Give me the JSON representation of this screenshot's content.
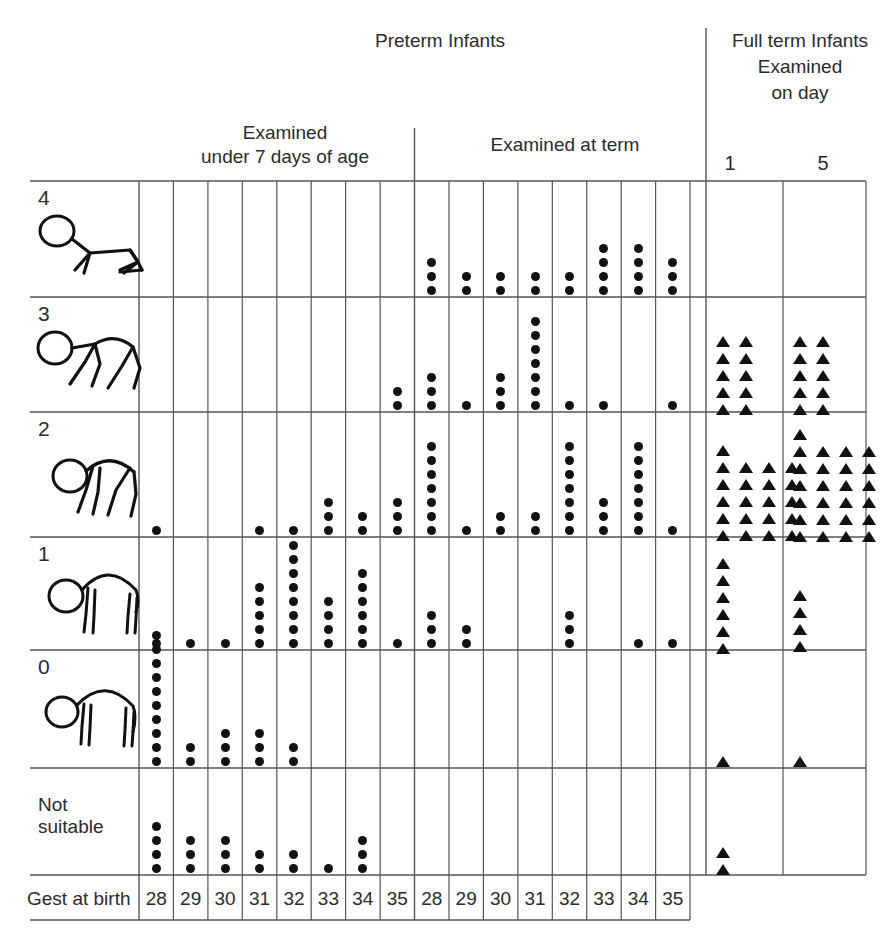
{
  "header": {
    "preterm_title": "Preterm Infants",
    "fullterm_title": "Full term Infants",
    "fullterm_line2": "Examined",
    "fullterm_line3": "on day",
    "group_under7_line1": "Examined",
    "group_under7_line2": "under 7 days of age",
    "group_atterm": "Examined at term",
    "day_labels": [
      "1",
      "5"
    ]
  },
  "axis": {
    "gest_label": "Gest at birth",
    "columns": [
      "28",
      "29",
      "30",
      "31",
      "32",
      "33",
      "34",
      "35",
      "28",
      "29",
      "30",
      "31",
      "32",
      "33",
      "34",
      "35"
    ]
  },
  "rows": [
    {
      "label": "4",
      "icon": "posture-4-icon"
    },
    {
      "label": "3",
      "icon": "posture-3-icon"
    },
    {
      "label": "2",
      "icon": "posture-2-icon"
    },
    {
      "label": "1",
      "icon": "posture-1-icon"
    },
    {
      "label": "0",
      "icon": "posture-0-icon"
    },
    {
      "label": "Not\nsuitable",
      "label_line1": "Not",
      "label_line2": "suitable",
      "icon": null
    }
  ],
  "chart_data": {
    "type": "table",
    "xlabel": "Gest at birth",
    "ylabel": "Posture score",
    "marker_preterm": "dot",
    "marker_fullterm": "triangle",
    "groups": [
      {
        "name": "Preterm Infants — Examined under 7 days of age",
        "categories": [
          "28",
          "29",
          "30",
          "31",
          "32",
          "33",
          "34",
          "35"
        ]
      },
      {
        "name": "Preterm Infants — Examined at term",
        "categories": [
          "28",
          "29",
          "30",
          "31",
          "32",
          "33",
          "34",
          "35"
        ]
      },
      {
        "name": "Full term Infants — Examined on day",
        "categories": [
          "1",
          "5"
        ]
      }
    ],
    "score_levels": [
      "4",
      "3",
      "2",
      "1",
      "0",
      "Not suitable"
    ],
    "series": [
      {
        "name": "4",
        "under7": [
          0,
          0,
          0,
          0,
          0,
          0,
          0,
          0
        ],
        "at_term": [
          3,
          2,
          2,
          2,
          2,
          4,
          4,
          3
        ],
        "full_term": [
          0,
          0
        ]
      },
      {
        "name": "3",
        "under7": [
          0,
          0,
          0,
          0,
          0,
          0,
          0,
          2
        ],
        "at_term": [
          3,
          1,
          3,
          7,
          1,
          1,
          0,
          1
        ],
        "full_term": [
          10,
          10
        ]
      },
      {
        "name": "2",
        "under7": [
          1,
          0,
          0,
          1,
          1,
          3,
          2,
          3
        ],
        "at_term": [
          7,
          1,
          2,
          2,
          7,
          3,
          7,
          1
        ],
        "full_term": [
          21,
          25
        ]
      },
      {
        "name": "1",
        "under7": [
          1,
          1,
          1,
          5,
          8,
          4,
          6,
          1
        ],
        "at_term": [
          3,
          2,
          0,
          0,
          3,
          0,
          1,
          1
        ],
        "full_term": [
          6,
          4
        ]
      },
      {
        "name": "0",
        "under7": [
          10,
          2,
          3,
          3,
          2,
          0,
          0,
          0
        ],
        "at_term": [
          0,
          0,
          0,
          0,
          0,
          0,
          0,
          0
        ],
        "full_term": [
          1,
          1
        ]
      },
      {
        "name": "Not suitable",
        "under7": [
          4,
          3,
          3,
          2,
          2,
          1,
          3,
          0
        ],
        "at_term": [
          0,
          0,
          0,
          0,
          0,
          0,
          0,
          0
        ],
        "full_term": [
          2,
          0
        ]
      }
    ]
  }
}
